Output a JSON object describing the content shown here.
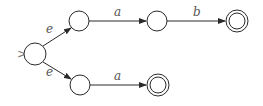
{
  "diagram": {
    "type": "finite-automaton",
    "colors": {
      "stroke": "#2a2a2a",
      "label": "#555555",
      "start_marker": "#777777",
      "background": "#ffffff"
    },
    "start_marker": ">",
    "states": [
      {
        "id": "q0",
        "cx": 35,
        "cy": 54,
        "r": 11,
        "start": true,
        "accepting": false
      },
      {
        "id": "q1",
        "cx": 79,
        "cy": 21,
        "r": 10,
        "start": false,
        "accepting": false
      },
      {
        "id": "q2",
        "cx": 157,
        "cy": 21,
        "r": 10,
        "start": false,
        "accepting": false
      },
      {
        "id": "q3",
        "cx": 237,
        "cy": 21,
        "r": 11,
        "start": false,
        "accepting": true
      },
      {
        "id": "q4",
        "cx": 80,
        "cy": 85,
        "r": 10,
        "start": false,
        "accepting": false
      },
      {
        "id": "q5",
        "cx": 158,
        "cy": 85,
        "r": 11,
        "start": false,
        "accepting": true
      }
    ],
    "transitions": [
      {
        "from": "q0",
        "to": "q1",
        "label": "e"
      },
      {
        "from": "q1",
        "to": "q2",
        "label": "a"
      },
      {
        "from": "q2",
        "to": "q3",
        "label": "b"
      },
      {
        "from": "q0",
        "to": "q4",
        "label": "e"
      },
      {
        "from": "q4",
        "to": "q5",
        "label": "a"
      }
    ]
  }
}
